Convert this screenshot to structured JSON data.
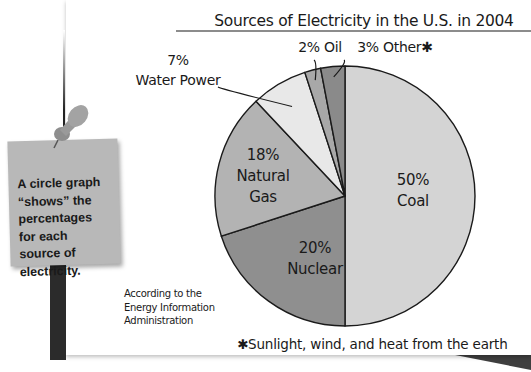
{
  "note": {
    "lines": [
      "A circle graph",
      "“shows” the",
      "percentages",
      "for each",
      "source of",
      "electricity."
    ]
  },
  "source_note": "According to the\nEnergy Information\nAdministration",
  "footnote": "✱Sunlight, wind, and heat from the earth",
  "colors": {
    "coal": "#d4d4d4",
    "nuclear": "#8f8f8f",
    "natural_gas": "#b3b3b3",
    "water_power": "#e8e8e8",
    "oil": "#a8a8a8",
    "other": "#8a8a8a",
    "note": "#b8b8b8",
    "outline": "#1a1a1a"
  },
  "chart_data": {
    "type": "pie",
    "title": "Sources of Electricity in the U.S. in 2004",
    "start": "top",
    "direction": "clockwise",
    "categories": [
      "Coal",
      "Nuclear",
      "Natural Gas",
      "Water Power",
      "Oil",
      "Other"
    ],
    "values": [
      50,
      20,
      18,
      7,
      2,
      3
    ],
    "unit": "%",
    "labels": [
      {
        "pct": "50%",
        "name": "Coal"
      },
      {
        "pct": "20%",
        "name": "Nuclear"
      },
      {
        "pct": "18%",
        "name": "Natural Gas"
      },
      {
        "pct": "7%",
        "name": "Water Power"
      },
      {
        "pct": "2%",
        "name": "Oil"
      },
      {
        "pct": "3%",
        "name": "Other✱"
      }
    ],
    "annotation": "✱Sunlight, wind, and heat from the earth"
  }
}
